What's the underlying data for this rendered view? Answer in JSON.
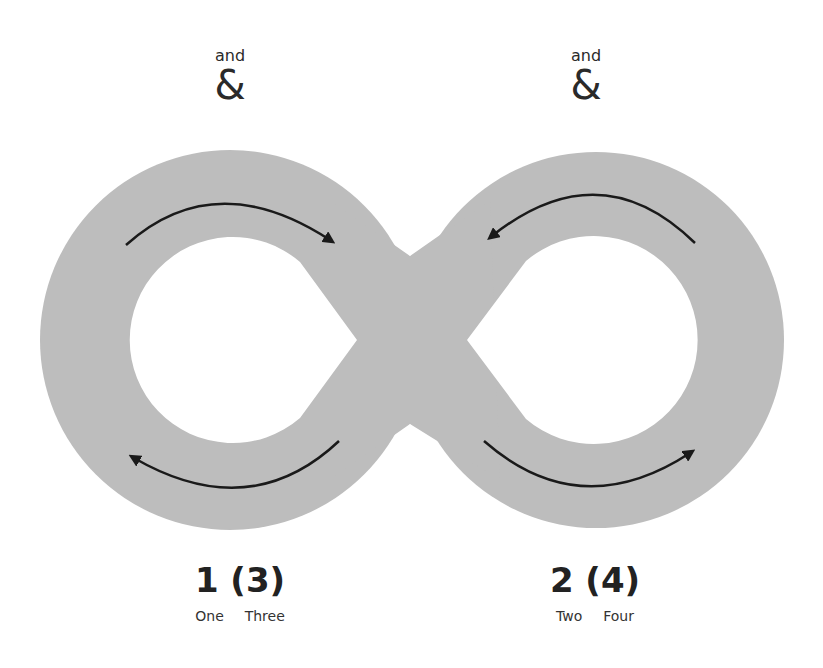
{
  "diagram": {
    "colors": {
      "band": "#bdbdbd",
      "arrow": "#1a1a1a",
      "text": "#2a2a2a",
      "background": "#ffffff"
    },
    "left_loop": {
      "top_word": "and",
      "top_symbol": "&",
      "number_label": "1 (3)",
      "words_label": "One  Three",
      "arrows": [
        {
          "position": "top",
          "direction": "clockwise",
          "icon": "curved-arrow-right-icon"
        },
        {
          "position": "bottom",
          "direction": "clockwise",
          "icon": "curved-arrow-left-icon"
        }
      ]
    },
    "right_loop": {
      "top_word": "and",
      "top_symbol": "&",
      "number_label": "2 (4)",
      "words_label": "Two  Four",
      "arrows": [
        {
          "position": "top",
          "direction": "counterclockwise",
          "icon": "curved-arrow-left-icon"
        },
        {
          "position": "bottom",
          "direction": "counterclockwise",
          "icon": "curved-arrow-right-icon"
        }
      ]
    }
  }
}
